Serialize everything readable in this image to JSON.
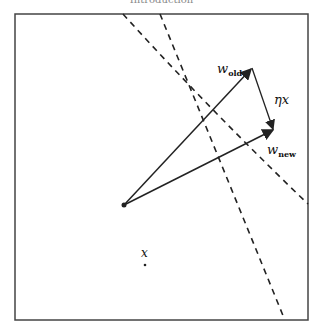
{
  "header": {
    "title": "Introduction"
  },
  "diagram": {
    "frame": {
      "x": 15,
      "y": 14,
      "w": 293,
      "h": 306
    },
    "origin": {
      "x": 124,
      "y": 205
    },
    "vectors": [
      {
        "name": "w_old",
        "label": "w",
        "sub": "old",
        "tip": {
          "x": 252,
          "y": 68
        }
      },
      {
        "name": "w_new",
        "label": "w",
        "sub": "new",
        "tip": {
          "x": 274,
          "y": 130
        }
      },
      {
        "name": "eta_x",
        "label": "ηx",
        "from": {
          "x": 252,
          "y": 68
        },
        "tip": {
          "x": 274,
          "y": 130
        }
      }
    ],
    "point_x": {
      "label": "x",
      "x": 145,
      "y": 265
    },
    "labels": {
      "w_old_main": "w",
      "w_old_sub": "old",
      "w_new_main": "w",
      "w_new_sub": "new",
      "eta_x": "ηx",
      "x": "x"
    },
    "colors": {
      "stroke": "#222222",
      "frame": "#444444"
    }
  }
}
